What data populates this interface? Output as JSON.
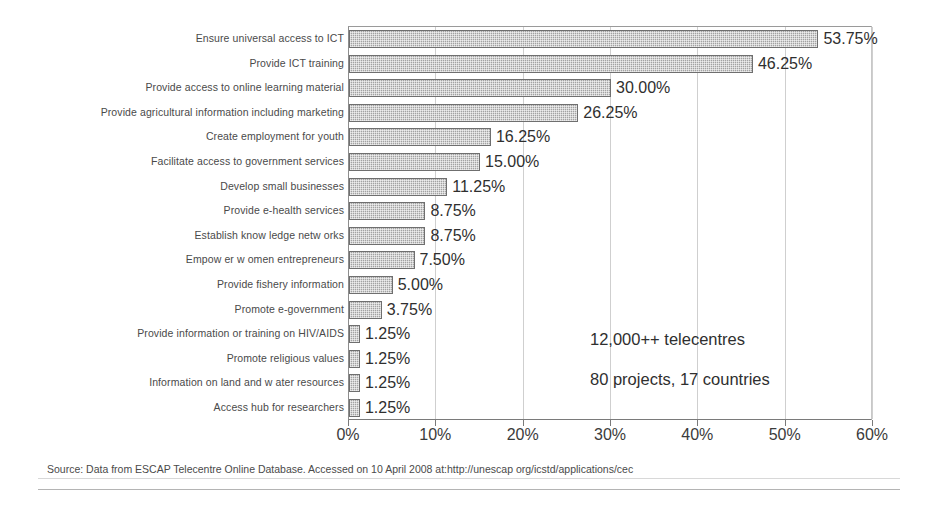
{
  "chart_data": {
    "type": "bar",
    "orientation": "horizontal",
    "title": "",
    "xlabel": "",
    "ylabel": "",
    "xlim": [
      0,
      60
    ],
    "xticks": [
      "0%",
      "10%",
      "20%",
      "30%",
      "40%",
      "50%",
      "60%"
    ],
    "xtick_values": [
      0,
      10,
      20,
      30,
      40,
      50,
      60
    ],
    "grid": true,
    "legend": "none",
    "value_suffix": "%",
    "categories": [
      "Ensure universal access to ICT",
      "Provide ICT training",
      "Provide access to online learning material",
      "Provide agricultural information including marketing",
      "Create employment for youth",
      "Facilitate access to government services",
      "Develop small businesses",
      "Provide e-health services",
      "Establish know ledge netw orks",
      "Empow er w omen entrepreneurs",
      "Provide fishery information",
      "Promote e-government",
      "Provide information or training on HIV/AIDS",
      "Promote religious values",
      "Information on land and w ater resources",
      "Access hub for researchers"
    ],
    "values": [
      53.75,
      46.25,
      30.0,
      26.25,
      16.25,
      15.0,
      11.25,
      8.75,
      8.75,
      7.5,
      5.0,
      3.75,
      1.25,
      1.25,
      1.25,
      1.25
    ],
    "value_labels": [
      "53.75%",
      "46.25%",
      "30.00%",
      "26.25%",
      "16.25%",
      "15.00%",
      "11.25%",
      "8.75%",
      "8.75%",
      "7.50%",
      "5.00%",
      "3.75%",
      "1.25%",
      "1.25%",
      "1.25%",
      "1.25%"
    ],
    "annotations": [
      "12,000++ telecentres",
      "80 projects, 17 countries"
    ],
    "colors": {
      "bar_fill": "#a2a2a2",
      "bar_border": "#6f6f6f",
      "grid": "#cfcfcf",
      "text": "#3a3a3a",
      "background": "#ffffff"
    }
  },
  "source": {
    "note": "Source: Data from ESCAP Telecentre Online Database. Accessed on 10 April 2008 at:http://unescap org/icstd/applications/cec"
  }
}
